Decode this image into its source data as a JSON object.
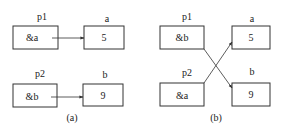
{
  "panels": [
    {
      "caption": "(a)",
      "pointers": [
        {
          "name": "p1",
          "value": "&a",
          "target": "a"
        },
        {
          "name": "p2",
          "value": "&b",
          "target": "b"
        }
      ],
      "variables": [
        {
          "name": "a",
          "value": "5"
        },
        {
          "name": "b",
          "value": "9"
        }
      ]
    },
    {
      "caption": "(b)",
      "pointers": [
        {
          "name": "p1",
          "value": "&b",
          "target": "b"
        },
        {
          "name": "p2",
          "value": "&a",
          "target": "a"
        }
      ],
      "variables": [
        {
          "name": "a",
          "value": "5"
        },
        {
          "name": "b",
          "value": "9"
        }
      ]
    }
  ],
  "colors": {
    "stroke": "#333333",
    "text": "#222222",
    "background": "#ffffff"
  }
}
